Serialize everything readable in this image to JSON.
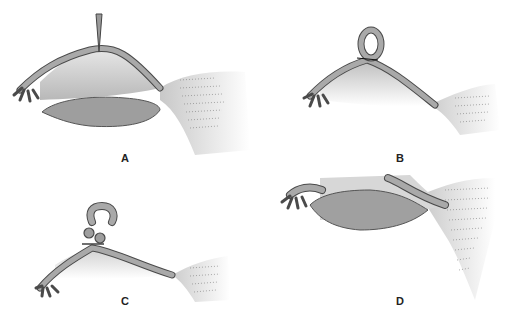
{
  "figure": {
    "panels": [
      {
        "id": "A",
        "label": "A",
        "description": "Fallopian tube elevated with clamp over ovary, fimbriae at left, broad ligament at right"
      },
      {
        "id": "B",
        "label": "B",
        "description": "Tubal loop tied with suture (Pomeroy ligation)"
      },
      {
        "id": "C",
        "label": "C",
        "description": "Excised loop segment above ligated tubal stumps"
      },
      {
        "id": "D",
        "label": "D",
        "description": "Tube and ovary after procedure, healed tube segments"
      }
    ]
  },
  "colors": {
    "tube_fill": "#a9a9a9",
    "tube_stroke": "#4a4a4a",
    "mesentery_fill": "#cfcfcf",
    "ovary_fill": "#9e9e9e",
    "ligament_fill": "#e6e6e6",
    "background": "#ffffff"
  }
}
